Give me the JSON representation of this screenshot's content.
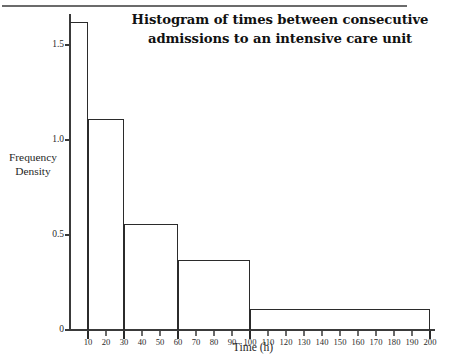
{
  "figure": {
    "title_line1": "Histogram of times between consecutive",
    "title_line2": "admissions to an intensive care unit",
    "has_top_rule": true
  },
  "chart_data": {
    "type": "bar",
    "title": "Histogram of times between consecutive admissions to an intensive care unit",
    "xlabel": "Time (h)",
    "ylabel_line1": "Frequency",
    "ylabel_line2": "Density",
    "ylabel": "Frequency Density",
    "xlim": [
      0,
      203
    ],
    "ylim": [
      0,
      1.67
    ],
    "grid": false,
    "legend": null,
    "bin_edges": [
      0,
      10,
      30,
      60,
      100,
      200
    ],
    "categories": [
      "0-10",
      "10-30",
      "30-60",
      "60-100",
      "100-200"
    ],
    "values": [
      1.62,
      1.11,
      0.56,
      0.37,
      0.11
    ],
    "bars": [
      {
        "from": 0,
        "to": 10,
        "density": 1.62
      },
      {
        "from": 10,
        "to": 30,
        "density": 1.11
      },
      {
        "from": 30,
        "to": 60,
        "density": 0.56
      },
      {
        "from": 60,
        "to": 100,
        "density": 0.37
      },
      {
        "from": 100,
        "to": 200,
        "density": 0.11
      }
    ],
    "y_ticks": [
      {
        "value": 0,
        "label": "0"
      },
      {
        "value": 0.5,
        "label": "0.5"
      },
      {
        "value": 1.0,
        "label": "1.0"
      },
      {
        "value": 1.5,
        "label": "1.5"
      }
    ],
    "x_ticks": [
      {
        "value": 10,
        "label": "10",
        "major": true
      },
      {
        "value": 20,
        "label": "20",
        "major": false
      },
      {
        "value": 30,
        "label": "30",
        "major": true
      },
      {
        "value": 40,
        "label": "40",
        "major": false
      },
      {
        "value": 50,
        "label": "50",
        "major": false
      },
      {
        "value": 60,
        "label": "60",
        "major": true
      },
      {
        "value": 70,
        "label": "70",
        "major": false
      },
      {
        "value": 80,
        "label": "80",
        "major": false
      },
      {
        "value": 90,
        "label": "90",
        "major": false
      },
      {
        "value": 100,
        "label": "100",
        "major": true
      },
      {
        "value": 110,
        "label": "110",
        "major": false
      },
      {
        "value": 120,
        "label": "120",
        "major": false
      },
      {
        "value": 130,
        "label": "130",
        "major": false
      },
      {
        "value": 140,
        "label": "140",
        "major": false
      },
      {
        "value": 150,
        "label": "150",
        "major": false
      },
      {
        "value": 160,
        "label": "160",
        "major": false
      },
      {
        "value": 170,
        "label": "170",
        "major": false
      },
      {
        "value": 180,
        "label": "180",
        "major": false
      },
      {
        "value": 190,
        "label": "190",
        "major": false
      },
      {
        "value": 200,
        "label": "200",
        "major": true
      }
    ],
    "colors": {
      "bar_outline": "#2b2b2b",
      "bar_fill": "transparent",
      "axis": "#3a3a3a",
      "text": "#1f1f1f",
      "background": "#ffffff"
    }
  }
}
